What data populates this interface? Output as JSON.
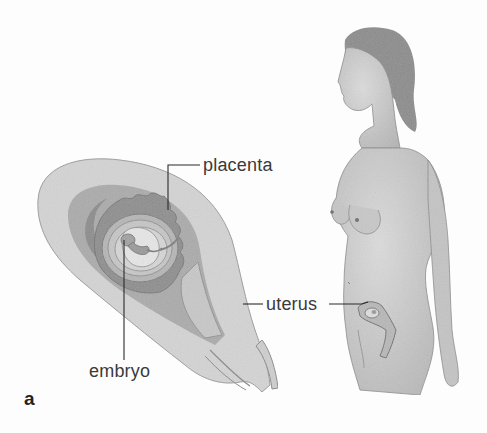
{
  "figure": {
    "panel_label": "a",
    "labels": {
      "placenta": "placenta",
      "embryo": "embryo",
      "uterus": "uterus"
    },
    "colors": {
      "background": "#fdfdfd",
      "uterus_outer_wall": "#d4d4d4",
      "uterus_mid_layer": "#ababab",
      "placenta": "#8e8e8e",
      "amniotic_layers": "#bdbdbd",
      "embryo_sac": "#e2e2e2",
      "embryo": "#9a9a9a",
      "skin": "#cfcfcf",
      "hair": "#8a8a8a",
      "leader_line": "#2a2a2a",
      "text": "#3a3a3a"
    }
  }
}
